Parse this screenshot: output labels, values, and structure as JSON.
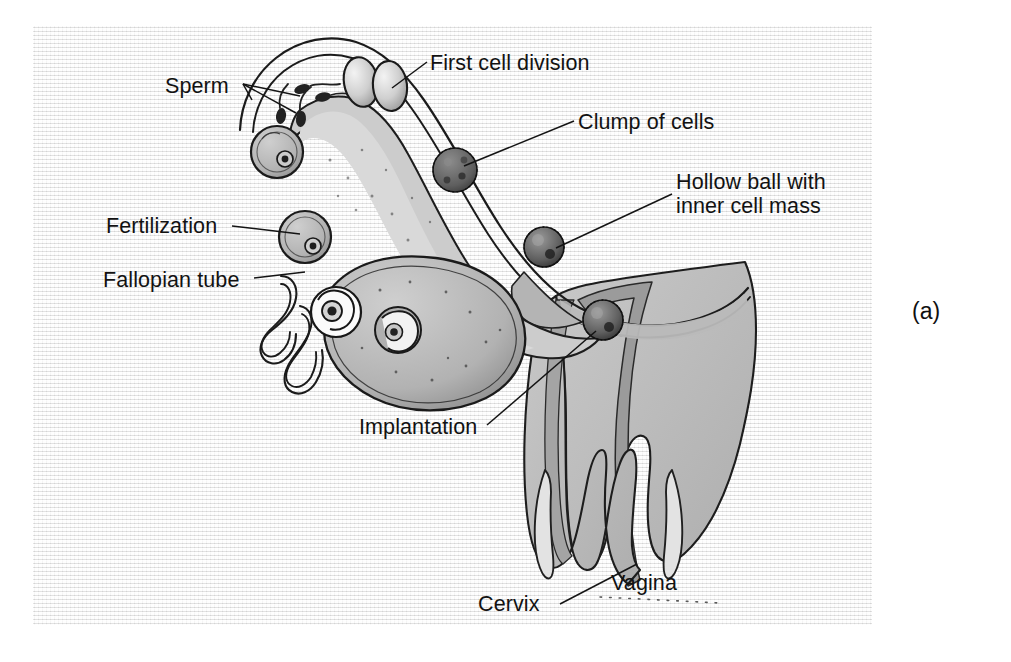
{
  "figure": {
    "panel_letter": "(a)",
    "background_color": "#f0f0f0",
    "ink_color": "#1a1a1a",
    "tissue_fill": "#bdbdbd",
    "ovary_fill": "#a9a9a9",
    "lumen_fill": "#dedede"
  },
  "labels": {
    "sperm": "Sperm",
    "first_cell_division": "First cell division",
    "clump_of_cells": "Clump of cells",
    "hollow_ball_line1": "Hollow ball with",
    "hollow_ball_line2": "inner cell mass",
    "fertilization": "Fertilization",
    "fallopian_tube": "Fallopian tube",
    "implantation": "Implantation",
    "vagina": "Vagina",
    "cervix": "Cervix"
  },
  "structures": {
    "uterus": "uterus-cavity",
    "ovary": "ovary-with-follicles",
    "fimbriae": "fimbriae-coils",
    "oviduct": "fallopian-tube-outline",
    "two_cell": "two-cell-stage",
    "morula": "morula-clump",
    "blastocyst_upper": "blastocyst-upper",
    "blastocyst_lower": "blastocyst-lower",
    "ovum_upper": "ovum-fertilized",
    "ovum_lower": "ovum-unfertilized",
    "sperm_cells": "sperm-cells",
    "cervix_canal": "cervix-canal",
    "vaginal_canal": "vaginal-canal"
  }
}
